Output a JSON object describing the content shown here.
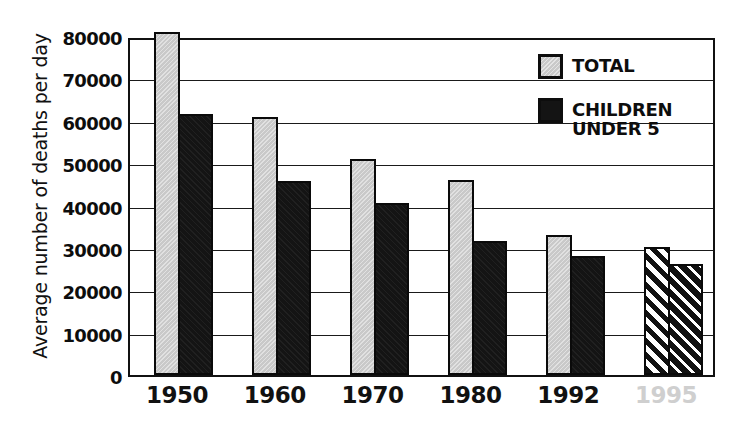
{
  "chart_data": {
    "type": "bar",
    "title": "",
    "xlabel": "",
    "ylabel": "Average number of deaths per day",
    "categories": [
      "1950",
      "1960",
      "1970",
      "1980",
      "1992",
      "1995"
    ],
    "projected_categories": [
      "1995"
    ],
    "ylim": [
      0,
      80000
    ],
    "ytick_values": [
      0,
      10000,
      20000,
      30000,
      40000,
      50000,
      60000,
      70000,
      80000
    ],
    "ytick_labels": [
      "0",
      "10000",
      "20000",
      "30000",
      "40000",
      "50000",
      "60000",
      "70000",
      "80000"
    ],
    "grid": true,
    "legend_position": "upper right",
    "series": [
      {
        "name": "TOTAL",
        "color": "#c9c9c9",
        "values": [
          81000,
          61000,
          51000,
          46000,
          33000,
          30200
        ],
        "projected_flags": [
          false,
          false,
          false,
          false,
          false,
          true
        ]
      },
      {
        "name": "CHILDREN UNDER 5",
        "color": "#141414",
        "values": [
          61500,
          45800,
          40500,
          31700,
          28000,
          26100
        ],
        "projected_flags": [
          false,
          false,
          false,
          false,
          false,
          true
        ]
      }
    ]
  },
  "legend": {
    "items": [
      {
        "label": "TOTAL",
        "swatch": "gray-swatch"
      },
      {
        "label": "CHILDREN\nUNDER 5",
        "swatch": "black-swatch"
      }
    ]
  },
  "caption": {
    "text": ""
  }
}
